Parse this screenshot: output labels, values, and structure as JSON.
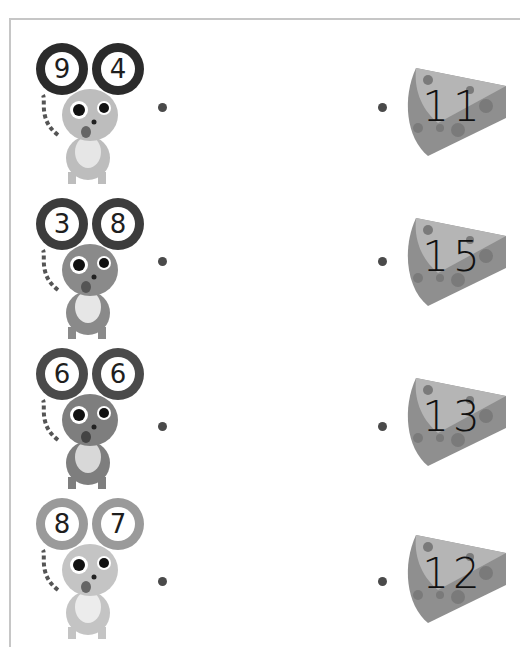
{
  "worksheet": {
    "type": "addition-matching",
    "frame_color": "#c6c6c6",
    "dot_color": "#4a4a4a",
    "mice": [
      {
        "left_ear": "9",
        "right_ear": "4",
        "ear_color": "#2b2b2b",
        "body_color": "#bdbdbd",
        "top": 40
      },
      {
        "left_ear": "3",
        "right_ear": "8",
        "ear_color": "#3c3c3c",
        "body_color": "#8a8a8a",
        "top": 195
      },
      {
        "left_ear": "6",
        "right_ear": "6",
        "ear_color": "#4a4a4a",
        "body_color": "#7e7e7e",
        "top": 345
      },
      {
        "left_ear": "8",
        "right_ear": "7",
        "ear_color": "#9a9a9a",
        "body_color": "#c4c4c4",
        "top": 495
      }
    ],
    "cheeses": [
      {
        "number": "11",
        "top": 68
      },
      {
        "number": "15",
        "top": 218
      },
      {
        "number": "13",
        "top": 373
      },
      {
        "number": "12",
        "top": 535
      }
    ]
  }
}
